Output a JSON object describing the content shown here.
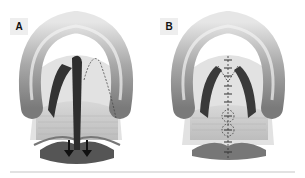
{
  "figure": {
    "panels": [
      {
        "label": "A",
        "description": "Palate with incision and posterior traction arrows"
      },
      {
        "label": "B",
        "description": "Palate after repair with sutured midline"
      }
    ],
    "colors": {
      "tube": "#9a9a9a",
      "tube_highlight": "#e0e0e0",
      "palate": "#dcdcdc",
      "muscle": "#c8c8c8",
      "dark": "#333333",
      "label_bg": "#eeeeee"
    }
  }
}
